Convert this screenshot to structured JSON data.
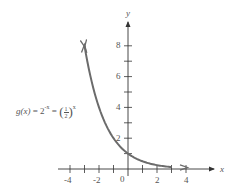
{
  "chart_data": {
    "type": "line",
    "title": "",
    "xlabel": "x",
    "ylabel": "y",
    "xlim": [
      -4.8,
      5.8
    ],
    "ylim": [
      0,
      9.5
    ],
    "grid": false,
    "x_ticks": [
      -4,
      -3,
      -2,
      -1,
      0,
      1,
      2,
      3,
      4
    ],
    "x_tick_labels": [
      "-4",
      "-2",
      "0",
      "2",
      "4"
    ],
    "y_ticks": [
      1,
      2,
      3,
      4,
      5,
      6,
      7,
      8
    ],
    "y_tick_labels": [
      "2",
      "4",
      "6",
      "8"
    ],
    "series": [
      {
        "name": "g(x) = 2^-x = (1/2)^x",
        "function": "2^(-x)",
        "x": [
          -3,
          -2.5,
          -2,
          -1.5,
          -1,
          -0.5,
          0,
          0.5,
          1,
          1.5,
          2,
          2.5,
          3
        ],
        "y": [
          8,
          5.657,
          4,
          2.828,
          2,
          1.414,
          1,
          0.707,
          0.5,
          0.354,
          0.25,
          0.177,
          0.125
        ],
        "color": "#6b6b6b",
        "arrows": "both"
      }
    ],
    "annotations": [
      {
        "text": "g(x) = 2^-x = (1/2)^x",
        "position": "left of curve near y=4"
      }
    ]
  },
  "labels": {
    "x_axis": "x",
    "y_axis": "y",
    "origin": "0",
    "x_ticks": {
      "neg4": "-4",
      "neg2": "-2",
      "pos2": "2",
      "pos4": "4"
    },
    "y_ticks": {
      "two": "2",
      "four": "4",
      "six": "6",
      "eight": "8"
    },
    "equation": {
      "lhs": "g(x)",
      "eq1": " = 2",
      "exp1": "-x",
      "eq2": " = ",
      "frac_num": "1",
      "frac_den": "2",
      "exp2": "x"
    }
  },
  "colors": {
    "axis": "#333333",
    "curve": "#6b6b6b",
    "text": "#555555"
  }
}
